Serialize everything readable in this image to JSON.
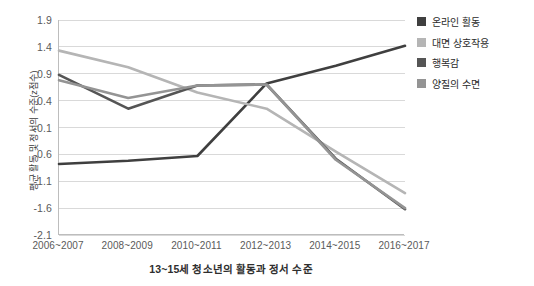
{
  "chart_data": {
    "type": "line",
    "title": "13~15세 청소년의 활동과 정서 수준",
    "xlabel": "",
    "ylabel": "평균 활동 및 정서의 수준(z점수)",
    "categories": [
      "2006~2007",
      "2008~2009",
      "2010~2011",
      "2012~2013",
      "2014~2015",
      "2016~2017"
    ],
    "ylim": [
      -2.1,
      1.9
    ],
    "yticks": [
      1.9,
      1.4,
      0.9,
      0.4,
      -0.1,
      -0.6,
      -1.1,
      -1.6,
      -2.1
    ],
    "ytick_labels": [
      "1.9",
      "1.4",
      "0.9",
      "0.4",
      "-0.1",
      "-0.6",
      "-1.1",
      "-1.6",
      "-2.1"
    ],
    "grid": true,
    "legend_position": "right",
    "series": [
      {
        "name": "온라인 활동",
        "color": "#3f3f3f",
        "values": [
          -0.78,
          -0.72,
          -0.63,
          0.72,
          1.05,
          1.42
        ]
      },
      {
        "name": "대면 상호작용",
        "color": "#b5b5b5",
        "values": [
          1.33,
          1.02,
          0.55,
          0.25,
          -0.55,
          -1.32
        ]
      },
      {
        "name": "행복감",
        "color": "#555555",
        "values": [
          0.88,
          0.25,
          0.68,
          0.7,
          -0.68,
          -1.62
        ]
      },
      {
        "name": "양질의 수면",
        "color": "#949494",
        "values": [
          0.78,
          0.45,
          0.68,
          0.7,
          -0.7,
          -1.6
        ]
      }
    ]
  }
}
